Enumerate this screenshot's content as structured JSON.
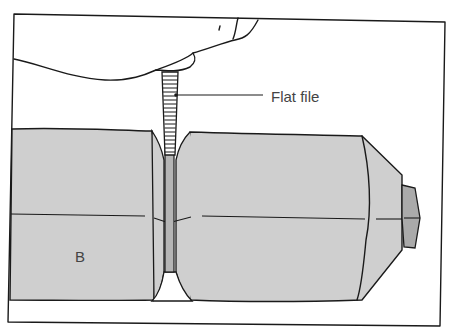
{
  "figure": {
    "labels": {
      "tool": "Flat file",
      "part": "B"
    },
    "colors": {
      "background": "#ffffff",
      "stroke": "#1a1a1a",
      "workpiece_fill": "#cfcfcf",
      "nut_fill": "#aaaaaa",
      "file_fill": "#b5b5b5",
      "label_text": "#444444"
    }
  }
}
